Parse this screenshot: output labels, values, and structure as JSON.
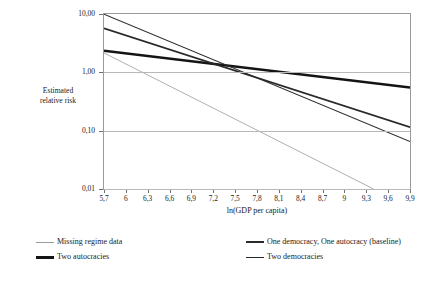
{
  "chart_data": {
    "type": "line",
    "title": "",
    "xlabel": "ln(GDP per capita)",
    "ylabel": "Estimated relative risk",
    "xlim": [
      5.7,
      9.9
    ],
    "ylim": [
      0.01,
      10.0
    ],
    "yscale": "log",
    "grid": true,
    "legend_position": "bottom",
    "x_ticks": [
      "5,7",
      "6",
      "6,3",
      "6,6",
      "6,9",
      "7,2",
      "7,5",
      "7,8",
      "8,1",
      "8,4",
      "8,7",
      "9",
      "9,3",
      "9,6",
      "9,9"
    ],
    "x_tick_values": [
      5.7,
      6.0,
      6.3,
      6.6,
      6.9,
      7.2,
      7.5,
      7.8,
      8.1,
      8.4,
      8.7,
      9.0,
      9.3,
      9.6,
      9.9
    ],
    "y_ticks": [
      "10,00",
      "1,00",
      "0,10",
      "0,01"
    ],
    "y_tick_values": [
      10.0,
      1.0,
      0.1,
      0.01
    ],
    "series": [
      {
        "name": "Missing regime data",
        "style": "thin-light",
        "color": "#9b9b9b",
        "width": 0.8,
        "x": [
          5.7,
          9.4
        ],
        "values": [
          2.15,
          0.01
        ]
      },
      {
        "name": "Two autocracies",
        "style": "thick",
        "color": "#141414",
        "width": 2.6,
        "x": [
          5.7,
          9.9
        ],
        "values": [
          2.35,
          0.55
        ]
      },
      {
        "name": "One democracy, One autocracy (baseline)",
        "style": "medium",
        "color": "#2a2a2a",
        "width": 1.8,
        "x": [
          5.7,
          9.9
        ],
        "values": [
          5.7,
          0.115
        ]
      },
      {
        "name": "Two democracies",
        "style": "thin",
        "color": "#2a2a2a",
        "width": 1.1,
        "x": [
          5.7,
          9.9
        ],
        "values": [
          9.9,
          0.065
        ]
      }
    ]
  },
  "axes": {
    "y_title_line1": "Estimated",
    "y_title_line2": "relative risk",
    "x_title": "ln(GDP per capita)"
  },
  "legend": {
    "items": [
      {
        "label": "Missing regime data"
      },
      {
        "label": "Two autocracies"
      },
      {
        "label": "One democracy, One autocracy (baseline)"
      },
      {
        "label": "Two democracies"
      }
    ]
  }
}
